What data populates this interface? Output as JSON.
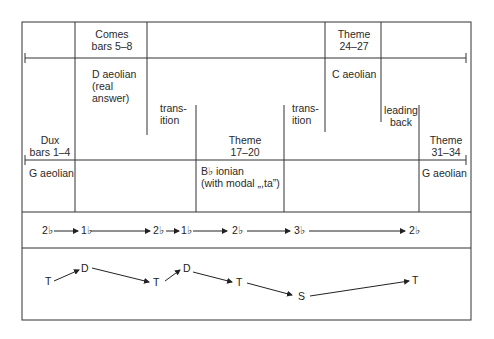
{
  "diagram": {
    "sections": [
      {
        "id": "dux",
        "title": "Dux",
        "bars": "bars 1–4",
        "mode": "G aeolian"
      },
      {
        "id": "comes",
        "title": "Comes",
        "bars": "bars 5–8",
        "mode": [
          "D aeolian",
          "(real",
          "answer)"
        ]
      },
      {
        "id": "transition-1",
        "lines": [
          "trans-",
          "ition"
        ]
      },
      {
        "id": "theme-17",
        "title": "Theme",
        "bars": "17–20",
        "mode": [
          "B♭ ionian",
          "(with modal „,ta”)"
        ]
      },
      {
        "id": "transition-2",
        "lines": [
          "trans-",
          "ition"
        ]
      },
      {
        "id": "theme-24",
        "title": "Theme",
        "bars": "24–27",
        "mode": "C aeolian"
      },
      {
        "id": "leading-back",
        "lines": [
          "leading",
          "back"
        ]
      },
      {
        "id": "theme-31",
        "title": "Theme",
        "bars": "31–34",
        "mode": "G aeolian"
      }
    ],
    "degree_sequence": [
      "2♭",
      "1♭",
      "2♭",
      "1♭",
      "2♭",
      "3♭",
      "2♭"
    ],
    "function_sequence": [
      "T",
      "D",
      "T",
      "D",
      "T",
      "S",
      "T"
    ]
  }
}
